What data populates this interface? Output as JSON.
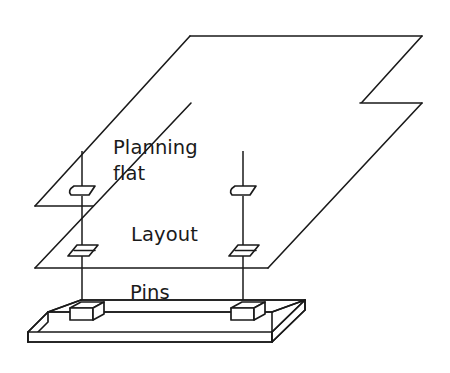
{
  "diagram": {
    "background_color": "#ffffff",
    "line_color": "#1a1a1a",
    "labels": {
      "planning_flat_line1": "Planning",
      "planning_flat_line2": "flat",
      "layout": "Layout",
      "pins": "Pins"
    },
    "layers": [
      {
        "id": "planning-flat",
        "name": "Planning flat",
        "type": "sheet",
        "hole_count": 2,
        "hole_shape": "slot"
      },
      {
        "id": "layout",
        "name": "Layout",
        "type": "sheet",
        "hole_count": 2,
        "hole_shape": "slot"
      },
      {
        "id": "pins-plate",
        "name": "Pins",
        "type": "base-plate",
        "pin_count": 2,
        "pin_shape": "rectangular-block"
      }
    ],
    "alignment_axes": 2
  }
}
